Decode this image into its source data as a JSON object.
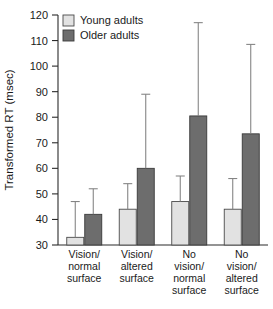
{
  "chart_data": {
    "type": "bar",
    "title": "",
    "xlabel": "",
    "ylabel": "Transformed RT (msec)",
    "ylim": [
      30,
      120
    ],
    "yticks": [
      30,
      40,
      50,
      60,
      70,
      80,
      90,
      100,
      110,
      120
    ],
    "ytick_labels": [
      "30",
      "40",
      "50",
      "60",
      "70",
      "80",
      "90",
      "100",
      "110",
      "120"
    ],
    "grid": false,
    "legend_position": "top-left",
    "categories": [
      "Vision/ normal surface",
      "Vision/ altered surface",
      "No vision/ normal surface",
      "No vision/ altered surface"
    ],
    "category_lines": [
      [
        "Vision/",
        "normal",
        "surface"
      ],
      [
        "Vision/",
        "altered",
        "surface"
      ],
      [
        "No",
        "vision/",
        "normal",
        "surface"
      ],
      [
        "No",
        "vision/",
        "altered",
        "surface"
      ]
    ],
    "series": [
      {
        "name": "Young adults",
        "color": "#e2e2e2",
        "values": [
          33,
          44,
          47,
          44
        ],
        "errors_upper": [
          47,
          54,
          57,
          56
        ]
      },
      {
        "name": "Older adults",
        "color": "#6d6d6d",
        "values": [
          42,
          60,
          80.5,
          73.5
        ],
        "errors_upper": [
          52,
          89,
          117,
          108.5
        ]
      }
    ]
  },
  "legend": {
    "items": [
      {
        "label": "Young adults",
        "swatch": "#e2e2e2"
      },
      {
        "label": "Older adults",
        "swatch": "#6d6d6d"
      }
    ]
  },
  "axes": {
    "y_title": "Transformed RT (msec)"
  }
}
